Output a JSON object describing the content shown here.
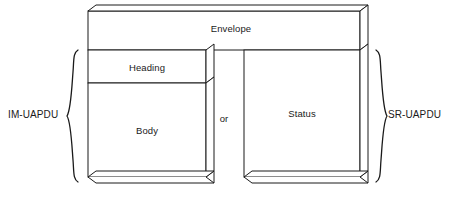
{
  "diagram": {
    "stroke_color": "#1a1a1a",
    "fill_color": "#ffffff",
    "boxes": [
      {
        "id": "envelope",
        "label": "Envelope"
      },
      {
        "id": "heading",
        "label": "Heading"
      },
      {
        "id": "body",
        "label": "Body"
      },
      {
        "id": "status",
        "label": "Status"
      }
    ],
    "connector": {
      "id": "or",
      "label": "or"
    },
    "braces": [
      {
        "id": "left-brace",
        "label": "IM-UAPDU",
        "side": "left"
      },
      {
        "id": "right-brace",
        "label": "SR-UAPDU",
        "side": "right"
      }
    ]
  }
}
